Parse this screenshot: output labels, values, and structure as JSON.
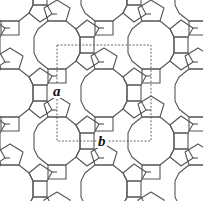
{
  "diagram": {
    "type": "crystal-framework-net",
    "colors": {
      "edge": "#555555",
      "cell": "#555555",
      "background": "#ffffff",
      "label": "#111111"
    },
    "unit_cell": {
      "x0": 57,
      "y0": 45,
      "x1": 151,
      "y1": 141
    },
    "lattice": {
      "period_x": 94,
      "period_y": 96,
      "centered": true
    },
    "labels": {
      "a": {
        "text": "a",
        "x": 52,
        "y": 84
      },
      "b": {
        "text": "b",
        "x": 97,
        "y": 134
      }
    }
  }
}
